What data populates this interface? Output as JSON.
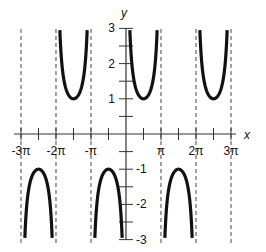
{
  "chart_data": {
    "type": "line",
    "title": "",
    "function": "y = csc(x)",
    "xlabel": "x",
    "ylabel": "y",
    "xlim": [
      -9.42478,
      9.42478
    ],
    "ylim": [
      -3,
      3
    ],
    "grid": false,
    "legend": null,
    "x_ticks": [
      {
        "value": -9.42478,
        "label": "-3π"
      },
      {
        "value": -7.85398,
        "label": ""
      },
      {
        "value": -6.28319,
        "label": "-2π"
      },
      {
        "value": -4.71239,
        "label": ""
      },
      {
        "value": -3.14159,
        "label": "-π"
      },
      {
        "value": -1.5708,
        "label": ""
      },
      {
        "value": 1.5708,
        "label": ""
      },
      {
        "value": 3.14159,
        "label": "π"
      },
      {
        "value": 4.71239,
        "label": ""
      },
      {
        "value": 6.28319,
        "label": "2π"
      },
      {
        "value": 7.85398,
        "label": ""
      },
      {
        "value": 9.42478,
        "label": "3π"
      }
    ],
    "y_ticks": [
      {
        "value": 3,
        "label": "3"
      },
      {
        "value": 2.5,
        "label": ""
      },
      {
        "value": 2,
        "label": "2"
      },
      {
        "value": 1.5,
        "label": ""
      },
      {
        "value": 1,
        "label": "1"
      },
      {
        "value": 0.5,
        "label": ""
      },
      {
        "value": -0.5,
        "label": ""
      },
      {
        "value": -1,
        "label": "-1"
      },
      {
        "value": -1.5,
        "label": ""
      },
      {
        "value": -2,
        "label": "-2"
      },
      {
        "value": -2.5,
        "label": ""
      },
      {
        "value": -3,
        "label": "-3"
      }
    ],
    "asymptotes": [
      -9.42478,
      -6.28319,
      -3.14159,
      3.14159,
      6.28319,
      9.42478
    ],
    "series": [
      {
        "name": "branch (-2π,-π)",
        "x_range": [
          -6.28319,
          -3.14159
        ],
        "vertex": {
          "x": -4.71239,
          "y": 1
        },
        "opens": "up"
      },
      {
        "name": "branch (0,π)",
        "x_range": [
          0,
          3.14159
        ],
        "vertex": {
          "x": 1.5708,
          "y": 1
        },
        "opens": "up"
      },
      {
        "name": "branch (2π,3π)",
        "x_range": [
          6.28319,
          9.42478
        ],
        "vertex": {
          "x": 7.85398,
          "y": 1
        },
        "opens": "up"
      },
      {
        "name": "branch (-3π,-2π)",
        "x_range": [
          -9.42478,
          -6.28319
        ],
        "vertex": {
          "x": -7.85398,
          "y": -1
        },
        "opens": "down"
      },
      {
        "name": "branch (-π,0)",
        "x_range": [
          -3.14159,
          0
        ],
        "vertex": {
          "x": -1.5708,
          "y": -1
        },
        "opens": "down"
      },
      {
        "name": "branch (π,2π)",
        "x_range": [
          3.14159,
          6.28319
        ],
        "vertex": {
          "x": 4.71239,
          "y": -1
        },
        "opens": "down"
      }
    ]
  },
  "colors": {
    "curve": "#111111",
    "axis": "#333333",
    "asymptote": "#444444"
  }
}
